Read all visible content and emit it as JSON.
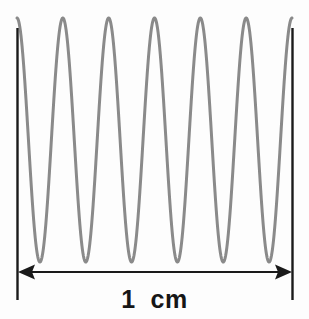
{
  "figure": {
    "kind": "scale-bar-waveform-figure",
    "background_color": "#fdfdfd",
    "width": 309,
    "height": 319
  },
  "scale_bar": {
    "label": "1  cm",
    "label_value": "1",
    "label_unit": "cm",
    "length_text": "1 cm",
    "line_color": "#1a1a1a",
    "arrow_style": "double-headed",
    "left_arrow_name": "left-arrowhead",
    "right_arrow_name": "right-arrowhead",
    "left_tick_name": "left-end-tick",
    "right_tick_name": "right-end-tick"
  },
  "waveform": {
    "stroke_color": "#8a8a8a",
    "stroke_width": 3,
    "shape": "sinusoid",
    "cycles_across_scale_bar": 6,
    "peak_count": 6,
    "trough_count": 6
  },
  "chart_data": {
    "type": "line",
    "title": "",
    "xlabel": "1  cm",
    "ylabel": "",
    "grid": false,
    "legend": null,
    "annotations": [
      "1  cm"
    ],
    "x_pixel_range": [
      17,
      292
    ],
    "y_pixel_range": [
      18,
      262
    ],
    "xlim": [
      0,
      1
    ],
    "ylim": [
      -1,
      1
    ],
    "series": [
      {
        "name": "waveform",
        "color": "#8a8a8a",
        "function": "sine",
        "cycles": 6,
        "amplitude": 1,
        "phase_deg": 90,
        "x": [
          0,
          0.0417,
          0.0833,
          0.125,
          0.1667,
          0.2083,
          0.25,
          0.2917,
          0.3333,
          0.375,
          0.4167,
          0.4583,
          0.5,
          0.5417,
          0.5833,
          0.625,
          0.6667,
          0.7083,
          0.75,
          0.7917,
          0.8333,
          0.875,
          0.9167,
          0.9583,
          1.0
        ],
        "values": [
          1,
          0,
          -1,
          0,
          1,
          0,
          -1,
          0,
          1,
          0,
          -1,
          0,
          1,
          0,
          -1,
          0,
          1,
          0,
          -1,
          0,
          1,
          0,
          -1,
          0,
          1
        ]
      }
    ]
  }
}
